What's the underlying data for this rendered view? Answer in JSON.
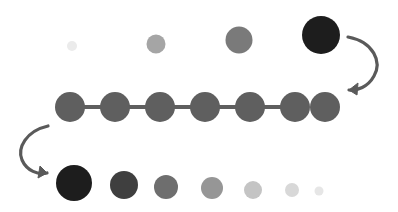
{
  "canvas": {
    "width": 398,
    "height": 212,
    "background": "#ffffff"
  },
  "palette": {
    "chain_gray": "#5f5f5f",
    "arrow_gray": "#5a5a5a",
    "black": "#1d1d1d"
  },
  "diagram": {
    "title": "Dot size and shade progression diagram",
    "groups": [
      {
        "id": "top-row",
        "name": "top-increasing-row",
        "description": "Row of four circles increasing in size and darkness from left to right",
        "baseline_y": 46,
        "circles": [
          {
            "name": "top-dot-1",
            "cx": 72,
            "cy": 46,
            "r": 5,
            "fill": "#ebebeb"
          },
          {
            "name": "top-dot-2",
            "cx": 156,
            "cy": 44,
            "r": 9.5,
            "fill": "#a5a5a5"
          },
          {
            "name": "top-dot-3",
            "cx": 239,
            "cy": 40,
            "r": 13.5,
            "fill": "#7a7a7a"
          },
          {
            "name": "top-dot-4",
            "cx": 321,
            "cy": 35,
            "r": 19,
            "fill": "#1d1d1d"
          }
        ]
      },
      {
        "id": "middle-chain",
        "name": "middle-uniform-chain",
        "description": "Seven equally sized gray circles joined by short horizontal connectors",
        "center_y": 107,
        "radius": 15,
        "count": 7,
        "first_cx": 70,
        "spacing": 45,
        "fill": "#5f5f5f",
        "connector": {
          "name": "chain-connector",
          "thickness": 4,
          "fill": "#5f5f5f"
        },
        "circles": [
          {
            "name": "chain-dot-1",
            "cx": 70,
            "cy": 107,
            "r": 15,
            "fill": "#5f5f5f"
          },
          {
            "name": "chain-dot-2",
            "cx": 115,
            "cy": 107,
            "r": 15,
            "fill": "#5f5f5f"
          },
          {
            "name": "chain-dot-3",
            "cx": 160,
            "cy": 107,
            "r": 15,
            "fill": "#5f5f5f"
          },
          {
            "name": "chain-dot-4",
            "cx": 205,
            "cy": 107,
            "r": 15,
            "fill": "#5f5f5f"
          },
          {
            "name": "chain-dot-5",
            "cx": 250,
            "cy": 107,
            "r": 15,
            "fill": "#5f5f5f"
          },
          {
            "name": "chain-dot-6",
            "cx": 295,
            "cy": 107,
            "r": 15,
            "fill": "#5f5f5f"
          },
          {
            "name": "chain-dot-7",
            "cx": 325,
            "cy": 107,
            "r": 15,
            "fill": "#5f5f5f"
          }
        ]
      },
      {
        "id": "bottom-row",
        "name": "bottom-decreasing-row",
        "description": "Row of seven circles decreasing in size and darkness from left to right",
        "circles": [
          {
            "name": "bottom-dot-1",
            "cx": 74,
            "cy": 183,
            "r": 18,
            "fill": "#1d1d1d"
          },
          {
            "name": "bottom-dot-2",
            "cx": 124,
            "cy": 185,
            "r": 14,
            "fill": "#3f3f3f"
          },
          {
            "name": "bottom-dot-3",
            "cx": 166,
            "cy": 187,
            "r": 12,
            "fill": "#6e6e6e"
          },
          {
            "name": "bottom-dot-4",
            "cx": 212,
            "cy": 188,
            "r": 11,
            "fill": "#969696"
          },
          {
            "name": "bottom-dot-5",
            "cx": 253,
            "cy": 190,
            "r": 9,
            "fill": "#c4c4c4"
          },
          {
            "name": "bottom-dot-6",
            "cx": 292,
            "cy": 190,
            "r": 7,
            "fill": "#d8d8d8"
          },
          {
            "name": "bottom-dot-7",
            "cx": 319,
            "cy": 191,
            "r": 4.5,
            "fill": "#e6e6e6"
          }
        ]
      }
    ],
    "arrows": [
      {
        "id": "arrow-right",
        "name": "curved-arrow-right-down",
        "description": "Clockwise curved arrow from the large dark top dot down to the right end of the chain",
        "stroke": "#5a5a5a",
        "width": 3.2,
        "path": "M 348 37 C 374 42 382 62 374 76 C 368 87 357 91 349 90",
        "head": "M 349 90 L 358 83 L 357 95 Z"
      },
      {
        "id": "arrow-left",
        "name": "curved-arrow-left-down",
        "description": "Counter-clockwise curved arrow from the left end of the chain down to the large dark bottom dot",
        "stroke": "#5a5a5a",
        "width": 3.2,
        "path": "M 48 126 C 26 131 17 148 22 160 C 27 171 38 175 47 173",
        "head": "M 47 173 L 38 178 L 40 166 Z"
      }
    ]
  }
}
